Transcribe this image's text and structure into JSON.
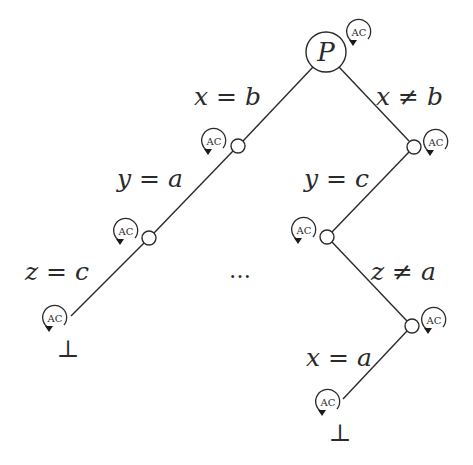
{
  "diagram": {
    "root": {
      "label": "P",
      "x": 326,
      "y": 52,
      "r": 20
    },
    "nodes": [
      {
        "id": "n1",
        "x": 238,
        "y": 146,
        "r": 7
      },
      {
        "id": "n2",
        "x": 414,
        "y": 147,
        "r": 7
      },
      {
        "id": "n3",
        "x": 149,
        "y": 238,
        "r": 7
      },
      {
        "id": "n4",
        "x": 327,
        "y": 237,
        "r": 7
      },
      {
        "id": "n5",
        "x": 412,
        "y": 326,
        "r": 7
      }
    ],
    "edges": [
      {
        "from": "root",
        "to": "n1",
        "label": "x = b"
      },
      {
        "from": "root",
        "to": "n2",
        "label": "x ≠ b"
      },
      {
        "from": "n1",
        "to": "n3",
        "label": "y = a"
      },
      {
        "from": "n2",
        "to": "n4",
        "label": "y = c"
      },
      {
        "from": "n3",
        "to": "leaf-left",
        "label": "z = c"
      },
      {
        "from": "n4",
        "to": "n5",
        "label": "z ≠ a"
      },
      {
        "from": "n5",
        "to": "leaf-right",
        "label": "x = a"
      }
    ],
    "edge_labels": {
      "x_eq_b": "x = b",
      "x_neq_b": "x ≠ b",
      "y_eq_a": "y = a",
      "y_eq_c": "y = c",
      "z_eq_c": "z = c",
      "z_neq_a": "z ≠ a",
      "x_eq_a": "x = a"
    },
    "leaves": [
      {
        "id": "leaf-left",
        "symbol": "⊥"
      },
      {
        "id": "leaf-right",
        "symbol": "⊥"
      }
    ],
    "ellipsis": "…",
    "ac_icon_label": "AC",
    "ac_icon_count": 8
  }
}
